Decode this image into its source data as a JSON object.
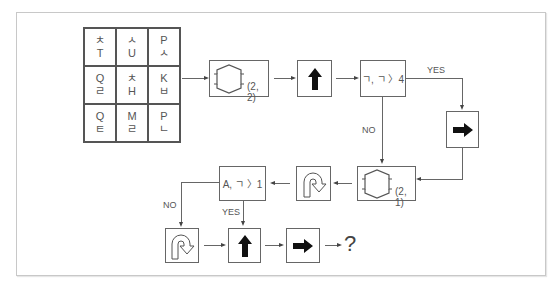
{
  "grid": {
    "cells": [
      {
        "top": "ㅊ",
        "bottom": "T"
      },
      {
        "top": "ㅅ",
        "bottom": "U"
      },
      {
        "top": "P",
        "bottom": "ㅅ"
      },
      {
        "top": "Q",
        "bottom": "ㄹ"
      },
      {
        "top": "ㅊ",
        "bottom": "H"
      },
      {
        "top": "K",
        "bottom": "ㅂ"
      },
      {
        "top": "Q",
        "bottom": "ㅌ"
      },
      {
        "top": "M",
        "bottom": "ㄹ"
      },
      {
        "top": "P",
        "bottom": "ㄴ"
      }
    ]
  },
  "flow": {
    "swap1": {
      "icon": "swap-icon",
      "param": "(2, 2)"
    },
    "step_up1": {
      "icon": "up-arrow-icon"
    },
    "cond1": {
      "text": "ㄱ, ㄱ 〉4"
    },
    "yes1": "YES",
    "no1": "NO",
    "step_right1": {
      "icon": "right-arrow-icon"
    },
    "swap2": {
      "icon": "swap-icon",
      "param": "(2, 1)"
    },
    "uturn1": {
      "icon": "u-turn-icon"
    },
    "cond2": {
      "text": "A, ㄱ 〉1"
    },
    "no2": "NO",
    "yes2": "YES",
    "uturn2": {
      "icon": "u-turn-icon"
    },
    "step_up2": {
      "icon": "up-arrow-icon"
    },
    "step_right2": {
      "icon": "right-arrow-icon"
    },
    "result": "?"
  }
}
